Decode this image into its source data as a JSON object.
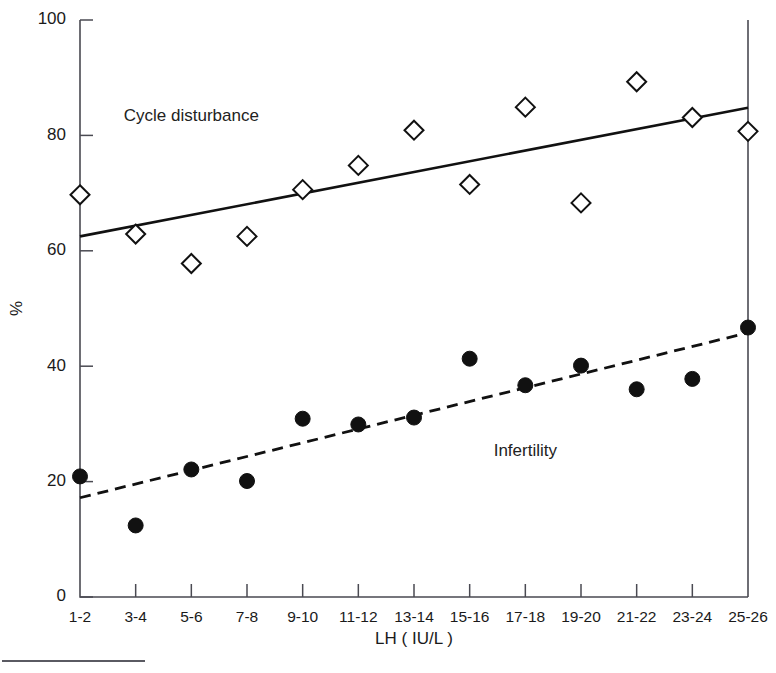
{
  "chart_data": {
    "type": "scatter",
    "title": "",
    "xlabel": "LH ( IU/L )",
    "ylabel": "%",
    "categories": [
      "1-2",
      "3-4",
      "5-6",
      "7-8",
      "9-10",
      "11-12",
      "13-14",
      "15-16",
      "17-18",
      "19-20",
      "21-22",
      "23-24",
      "25-26"
    ],
    "ylim": [
      0,
      100
    ],
    "yticks": [
      0,
      20,
      40,
      60,
      80,
      100
    ],
    "ytick_labels": [
      "0",
      "20",
      "40",
      "60",
      "80",
      "100"
    ],
    "grid": false,
    "legend": "inline-annotations",
    "series": [
      {
        "name": "Cycle disturbance",
        "marker": "open-diamond",
        "values": [
          69.7,
          62.9,
          57.8,
          62.5,
          70.6,
          74.8,
          80.9,
          71.5,
          84.9,
          68.3,
          89.3,
          83.1,
          80.7
        ],
        "trend": {
          "style": "solid",
          "y_start": 62.5,
          "y_end": 84.8
        },
        "annotation": {
          "text": "Cycle disturbance",
          "x_category": "5-6",
          "y": 82.5
        }
      },
      {
        "name": "Infertility",
        "marker": "filled-circle",
        "values": [
          20.9,
          12.4,
          22.1,
          20.1,
          30.9,
          29.9,
          31.1,
          41.3,
          36.7,
          40.1,
          36.0,
          37.8,
          46.7
        ],
        "trend": {
          "style": "dashed",
          "y_start": 17.2,
          "y_end": 45.8
        },
        "annotation": {
          "text": "Infertility",
          "x_category": "17-18",
          "y": 24.5
        }
      }
    ]
  },
  "figure": {
    "axis_color": "#4a4a52",
    "ink_color": "#111111",
    "background": "#ffffff"
  }
}
